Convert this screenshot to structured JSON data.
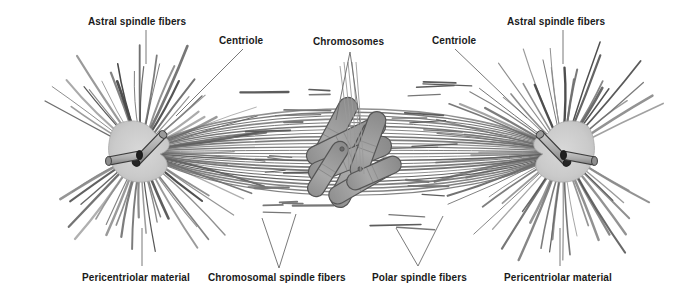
{
  "figure": {
    "background_color": "#ffffff",
    "width": 700,
    "height": 302
  },
  "labels": {
    "astral_left": "Astral spindle fibers",
    "centriole_left": "Centriole",
    "chromosomes": "Chromosomes",
    "centriole_right": "Centriole",
    "astral_right": "Astral spindle fibers",
    "pericentriolar_left": "Pericentriolar material",
    "chromosomal_fibers": "Chromosomal spindle fibers",
    "polar_fibers": "Polar spindle fibers",
    "pericentriolar_right": "Pericentriolar material"
  },
  "colors": {
    "line": "#555555",
    "fiber_dark": "#4a4a4a",
    "fiber_mid": "#6f6f6f",
    "centrosome_fill": "#c9c9c9",
    "centrosome_stroke": "#8a8a8a",
    "centriole_fill": "#b4b4b4",
    "centriole_stroke": "#3a3a3a",
    "centriole_cap": "#2b2b2b",
    "chromosome_fill": "#9d9d9d",
    "chromosome_stroke": "#555555",
    "text": "#1a1a1a",
    "leader": "#6a6a6a"
  },
  "structures": {
    "pole_left": {
      "cx": 140,
      "cy": 152,
      "name": "left-centrosome"
    },
    "pole_right": {
      "cx": 563,
      "cy": 152,
      "name": "right-centrosome"
    },
    "metaphase_plate": {
      "cx": 352,
      "cy": 155,
      "name": "chromosome-cluster"
    },
    "chromosome_count": 4,
    "astral_fiber_count_per_pole": 62,
    "spindle_fiber_count": 26
  },
  "chart_data": {
    "type": "diagram",
    "annotations": [
      "Astral spindle fibers",
      "Centriole",
      "Chromosomes",
      "Centriole",
      "Astral spindle fibers",
      "Pericentriolar material",
      "Chromosomal spindle fibers",
      "Polar spindle fibers",
      "Pericentriolar material"
    ]
  }
}
